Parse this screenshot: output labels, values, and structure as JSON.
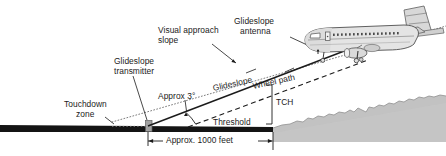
{
  "diagram": {
    "background_color": "#ffffff",
    "ink_color": "#1b1b1b",
    "terrain_fill": "#bdbdbd",
    "terrain_stroke": "#8d8d8d",
    "runway_color": "#1a1a1a",
    "marker_color": "#9a9a9a"
  },
  "labels": {
    "visual_approach_slope_line1": "Visual approach",
    "visual_approach_slope_line2": "slope",
    "glideslope_antenna_line1": "Glideslope",
    "glideslope_antenna_line2": "antenna",
    "glideslope_transmitter_line1": "Glideslope",
    "glideslope_transmitter_line2": "transmitter",
    "approx_angle": "Approx 3°",
    "glideslope": "Glideslope",
    "wheel_path": "Wheel path",
    "tch": "TCH",
    "touchdown_zone_line1": "Touchdown",
    "touchdown_zone_line2": "zone",
    "threshold": "Threshold",
    "approx_distance": "Approx. 1000 feet"
  },
  "values": {
    "glide_angle_degrees": 3,
    "touchdown_distance_feet": 1000,
    "threshold_crossing_height_abbrev": "TCH"
  },
  "aircraft": {
    "type_hint": "twin-engine jet airliner",
    "view": "rear three-quarter left"
  }
}
